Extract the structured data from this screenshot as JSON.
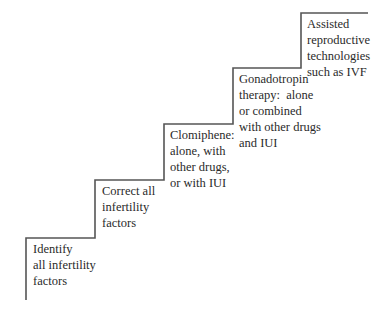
{
  "diagram": {
    "type": "staircase",
    "line_color": "#555555",
    "text_color": "#2a2a2a",
    "steps": [
      {
        "order": 1,
        "lines": [
          "Identify",
          "all infertility",
          "factors"
        ]
      },
      {
        "order": 2,
        "lines": [
          "Correct all",
          "infertility",
          "factors"
        ]
      },
      {
        "order": 3,
        "lines": [
          "Clomiphene:",
          "alone, with",
          "other drugs,",
          "or with IUI"
        ]
      },
      {
        "order": 4,
        "lines": [
          "Gonadotropin",
          "therapy:  alone",
          "or combined",
          "with other drugs",
          "and IUI"
        ]
      },
      {
        "order": 5,
        "lines": [
          "Assisted",
          "reproductive",
          "technologies",
          "such as IVF"
        ]
      }
    ]
  }
}
